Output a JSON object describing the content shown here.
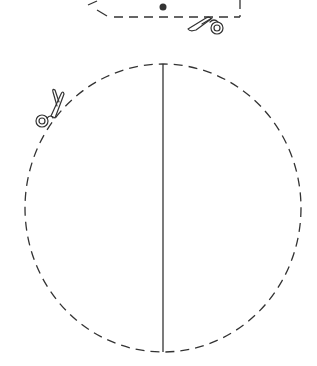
{
  "figure": {
    "colors": {
      "line": "#333333",
      "background": "#ffffff"
    },
    "top_shape": {
      "center_dot": {
        "cx": 163,
        "cy": 7,
        "r": 3.5
      },
      "cut_line": "dashed",
      "icon": "scissors-icon"
    },
    "circle": {
      "cx": 163,
      "cy": 208,
      "rx": 138,
      "ry": 144,
      "outline": "dashed",
      "fold_line": {
        "x": 163,
        "y1": 64,
        "y2": 352,
        "style": "solid"
      },
      "icon": "scissors-icon"
    }
  }
}
